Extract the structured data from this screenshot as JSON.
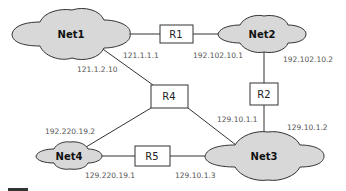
{
  "networks": [
    {
      "id": "net1",
      "label": "Net1"
    },
    {
      "id": "net2",
      "label": "Net2"
    },
    {
      "id": "net3",
      "label": "Net3"
    },
    {
      "id": "net4",
      "label": "Net4"
    }
  ],
  "routers": [
    {
      "id": "r1",
      "label": "R1"
    },
    {
      "id": "r2",
      "label": "R2"
    },
    {
      "id": "r4",
      "label": "R4"
    },
    {
      "id": "r5",
      "label": "R5"
    }
  ],
  "addresses": {
    "net1_r1": "121.1.1.1",
    "net1_r4": "121.1.2.10",
    "net2_r1": "192.102.10.1",
    "net2_r2": "192.102.10.2",
    "net3_r4": "129.10.1.1",
    "net3_r2": "129.10.1.2",
    "net3_r5": "129.10.1.3",
    "net4_r4": "192.220.19.2",
    "net4_r5": "129.220.19.1"
  },
  "colors": {
    "cloud_fill": "#d8d8d8",
    "stroke": "#333333",
    "label": "#555555"
  }
}
